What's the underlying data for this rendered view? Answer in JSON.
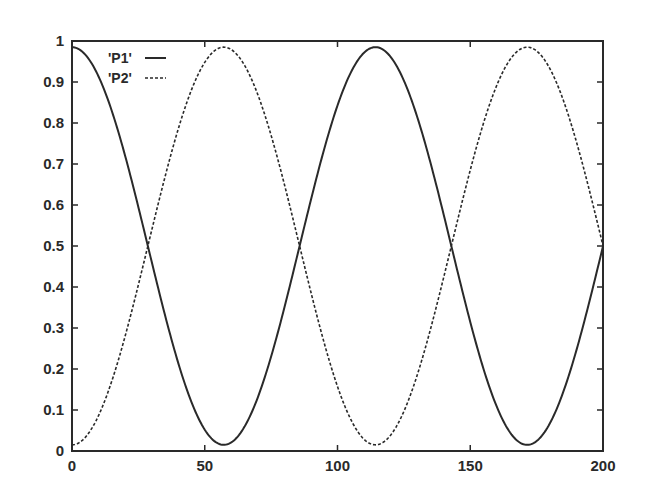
{
  "chart_data": {
    "type": "line",
    "title": "",
    "xlabel": "",
    "ylabel": "",
    "xlim": [
      0,
      200
    ],
    "ylim": [
      0,
      1
    ],
    "grid": false,
    "legend_position": "top-left (inside)",
    "x_ticks": [
      0,
      50,
      100,
      150,
      200
    ],
    "x_tick_labels": [
      "0",
      "50",
      "100",
      "150",
      "200"
    ],
    "y_ticks": [
      0,
      0.1,
      0.2,
      0.3,
      0.4,
      0.5,
      0.6,
      0.7,
      0.8,
      0.9,
      1
    ],
    "y_tick_labels": [
      "0",
      "0.1",
      "0.2",
      "0.3",
      "0.4",
      "0.5",
      "0.6",
      "0.7",
      "0.8",
      "0.9",
      "1"
    ],
    "model": {
      "description": "P1 oscillates as cos^2 with period ~114.3; P2 = 1 - P1",
      "period": 114.3,
      "min": 0.015,
      "max": 0.985
    },
    "series": [
      {
        "name": "'P1'",
        "style": "solid",
        "x": [
          0,
          10,
          20,
          28.6,
          40,
          50,
          57.2,
          65,
          75,
          85.7,
          95,
          105,
          114.3,
          125,
          135,
          142.9,
          150,
          160,
          171.5,
          180,
          190,
          200
        ],
        "values": [
          0.985,
          0.91,
          0.71,
          0.5,
          0.24,
          0.07,
          0.015,
          0.06,
          0.25,
          0.5,
          0.74,
          0.93,
          0.985,
          0.9,
          0.67,
          0.5,
          0.31,
          0.1,
          0.015,
          0.07,
          0.27,
          0.5
        ]
      },
      {
        "name": "'P2'",
        "style": "dashed",
        "x": [
          0,
          10,
          20,
          28.6,
          40,
          50,
          57.2,
          65,
          75,
          85.7,
          95,
          105,
          114.3,
          125,
          135,
          142.9,
          150,
          160,
          171.5,
          180,
          190,
          200
        ],
        "values": [
          0.015,
          0.09,
          0.29,
          0.5,
          0.76,
          0.93,
          0.985,
          0.94,
          0.75,
          0.5,
          0.26,
          0.07,
          0.015,
          0.1,
          0.33,
          0.5,
          0.69,
          0.9,
          0.985,
          0.93,
          0.73,
          0.5
        ]
      }
    ],
    "legend": [
      {
        "label": "'P1'",
        "style": "solid"
      },
      {
        "label": "'P2'",
        "style": "dashed"
      }
    ]
  },
  "colors": {
    "line": "#2a2a2a",
    "axis": "#2a2a2a",
    "background": "#ffffff"
  }
}
